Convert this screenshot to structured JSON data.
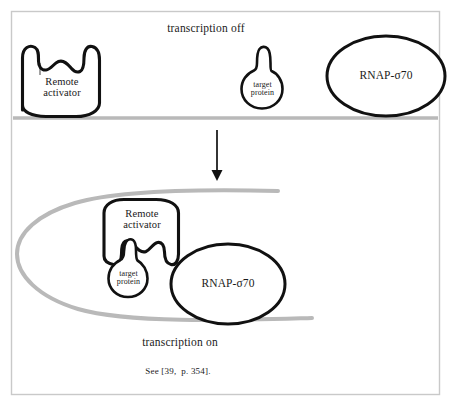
{
  "figure": {
    "kind": "biology-schematic",
    "topic": "DNA looping transcription activation",
    "frame_color": "#c9c9c9",
    "ink_color": "#111111",
    "dna_color": "#b9b9b9",
    "background": "#ffffff"
  },
  "top_panel": {
    "state_label": "transcription off",
    "dna_strand_name": "dna-strand-straight",
    "remote_activator": {
      "label_line1": "Remote",
      "label_line2": "activator",
      "shape": "cup-with-two-bumps"
    },
    "target_protein": {
      "label_line1": "target",
      "label_line2": "protein",
      "shape": "circle-with-stalk"
    },
    "rnap": {
      "label": "RNAP-σ70",
      "shape": "ellipse"
    }
  },
  "transition": {
    "arrow_name": "downward-arrow",
    "direction": "down"
  },
  "bottom_panel": {
    "state_label": "transcription on",
    "dna_strand_name": "dna-strand-looped",
    "remote_activator": {
      "label_line1": "Remote",
      "label_line2": "activator",
      "shape": "cup-with-two-bumps-inverted"
    },
    "target_protein": {
      "label_line1": "target",
      "label_line2": "protein",
      "shape": "circle-with-stalk"
    },
    "rnap": {
      "label": "RNAP-σ70",
      "shape": "ellipse"
    }
  },
  "caption": {
    "text": "See [39,  p. 354]."
  }
}
